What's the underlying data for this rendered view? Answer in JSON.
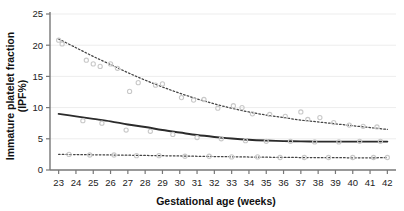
{
  "chart_data": {
    "type": "scatter",
    "title": "",
    "xlabel": "Gestational age (weeks)",
    "ylabel": "Immature platelet fraction (IPF%)",
    "ylabel_line1": "Immature platelet fraction",
    "ylabel_line2": "(IPF%)",
    "xlim": [
      22.5,
      42.5
    ],
    "ylim": [
      0,
      25
    ],
    "xticks": [
      23,
      24,
      25,
      26,
      27,
      28,
      29,
      30,
      31,
      32,
      33,
      34,
      35,
      36,
      37,
      38,
      39,
      40,
      41,
      42
    ],
    "yticks": [
      0,
      5,
      10,
      15,
      20,
      25
    ],
    "grid": "horizontal",
    "legend": "none",
    "series": [
      {
        "name": "97.5th centile",
        "style": "dotted",
        "color": "#444444",
        "x": [
          23,
          24,
          25,
          26,
          27,
          28,
          29,
          30,
          31,
          32,
          33,
          34,
          35,
          36,
          37,
          38,
          39,
          40,
          41,
          42
        ],
        "values": [
          21.0,
          19.6,
          18.2,
          16.9,
          15.6,
          14.4,
          13.3,
          12.3,
          11.4,
          10.6,
          9.9,
          9.3,
          8.8,
          8.4,
          8.0,
          7.7,
          7.4,
          7.1,
          6.8,
          6.5
        ]
      },
      {
        "name": "50th centile",
        "style": "solid",
        "color": "#2b2b2b",
        "x": [
          23,
          24,
          25,
          26,
          27,
          28,
          29,
          30,
          31,
          32,
          33,
          34,
          35,
          36,
          37,
          38,
          39,
          40,
          41,
          42
        ],
        "values": [
          9.0,
          8.6,
          8.2,
          7.8,
          7.3,
          6.9,
          6.4,
          6.0,
          5.6,
          5.3,
          5.05,
          4.85,
          4.72,
          4.63,
          4.58,
          4.55,
          4.54,
          4.54,
          4.54,
          4.55
        ]
      },
      {
        "name": "2.5th centile",
        "style": "dotted",
        "color": "#444444",
        "x": [
          23,
          24,
          25,
          26,
          27,
          28,
          29,
          30,
          31,
          32,
          33,
          34,
          35,
          36,
          37,
          38,
          39,
          40,
          41,
          42
        ],
        "values": [
          2.5,
          2.47,
          2.44,
          2.41,
          2.37,
          2.33,
          2.29,
          2.25,
          2.2,
          2.16,
          2.12,
          2.08,
          2.05,
          2.02,
          2.0,
          1.98,
          1.97,
          1.96,
          1.96,
          1.97
        ]
      }
    ],
    "scatter": {
      "name": "observations",
      "marker": "open-circle",
      "color": "#c9c9c9",
      "points": [
        [
          23.0,
          20.8
        ],
        [
          23.2,
          20.2
        ],
        [
          24.6,
          17.6
        ],
        [
          25.0,
          17.0
        ],
        [
          25.4,
          16.6
        ],
        [
          26.0,
          17.0
        ],
        [
          26.4,
          16.3
        ],
        [
          27.1,
          12.6
        ],
        [
          27.6,
          14.0
        ],
        [
          28.6,
          13.6
        ],
        [
          29.0,
          13.8
        ],
        [
          30.1,
          11.6
        ],
        [
          30.8,
          11.2
        ],
        [
          31.4,
          11.3
        ],
        [
          32.2,
          9.9
        ],
        [
          33.1,
          10.3
        ],
        [
          33.6,
          10.0
        ],
        [
          34.2,
          9.0
        ],
        [
          35.2,
          8.9
        ],
        [
          36.1,
          8.6
        ],
        [
          37.0,
          9.3
        ],
        [
          37.4,
          8.1
        ],
        [
          38.1,
          8.4
        ],
        [
          38.9,
          7.6
        ],
        [
          39.8,
          7.2
        ],
        [
          40.6,
          7.0
        ],
        [
          41.4,
          6.9
        ],
        [
          24.4,
          7.9
        ],
        [
          25.5,
          7.5
        ],
        [
          26.9,
          6.4
        ],
        [
          28.3,
          6.2
        ],
        [
          29.6,
          5.7
        ],
        [
          31.0,
          5.2
        ],
        [
          32.4,
          5.0
        ],
        [
          33.8,
          4.7
        ],
        [
          35.0,
          4.6
        ],
        [
          36.4,
          4.6
        ],
        [
          37.8,
          4.5
        ],
        [
          39.2,
          4.5
        ],
        [
          40.4,
          4.6
        ],
        [
          41.6,
          4.6
        ],
        [
          23.6,
          2.5
        ],
        [
          24.8,
          2.4
        ],
        [
          26.2,
          2.4
        ],
        [
          27.5,
          2.3
        ],
        [
          28.8,
          2.3
        ],
        [
          30.3,
          2.2
        ],
        [
          31.7,
          2.2
        ],
        [
          33.0,
          2.1
        ],
        [
          34.5,
          2.1
        ],
        [
          35.8,
          2.0
        ],
        [
          37.2,
          2.0
        ],
        [
          38.6,
          2.0
        ],
        [
          40.0,
          2.0
        ],
        [
          41.2,
          2.0
        ],
        [
          42.0,
          2.0
        ]
      ]
    }
  },
  "colors": {
    "axis": "#777777",
    "grid": "#ededed",
    "solid_line": "#2b2b2b",
    "dotted_line": "#4a4a4a",
    "marker": "#cccccc",
    "text": "#141414",
    "background": "#ffffff"
  }
}
